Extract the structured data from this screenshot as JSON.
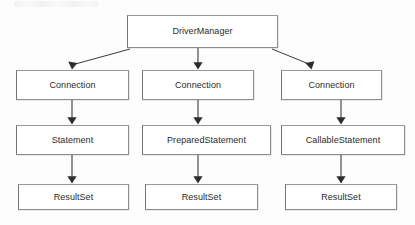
{
  "diagram": {
    "type": "hierarchical-flow",
    "background_color": "#fdfdfd",
    "box_fill_color": "#ffffff",
    "box_border_color": "#8d8d90",
    "text_color": "#2b2b2b",
    "connector_color": "#3a3a3a",
    "artifact_note": "faint illegible scan artifact strip at top-left"
  },
  "nodes": {
    "driver_manager": {
      "label": "DriverManager"
    },
    "connection_left": {
      "label": "Connection"
    },
    "connection_mid": {
      "label": "Connection"
    },
    "connection_right": {
      "label": "Connection"
    },
    "statement": {
      "label": "Statement"
    },
    "prepared_statement": {
      "label": "PreparedStatement"
    },
    "callable_statement": {
      "label": "CallableStatement"
    },
    "result_set_left": {
      "label": "ResultSet"
    },
    "result_set_mid": {
      "label": "ResultSet"
    },
    "result_set_right": {
      "label": "ResultSet"
    }
  },
  "edges": [
    {
      "from": "driver_manager",
      "to": "connection_left",
      "style": "diagonal-arrow"
    },
    {
      "from": "driver_manager",
      "to": "connection_mid",
      "style": "vertical-arrow"
    },
    {
      "from": "driver_manager",
      "to": "connection_right",
      "style": "diagonal-arrow"
    },
    {
      "from": "connection_left",
      "to": "statement",
      "style": "vertical-arrow"
    },
    {
      "from": "connection_mid",
      "to": "prepared_statement",
      "style": "vertical-arrow"
    },
    {
      "from": "connection_right",
      "to": "callable_statement",
      "style": "vertical-arrow"
    },
    {
      "from": "statement",
      "to": "result_set_left",
      "style": "vertical-arrow"
    },
    {
      "from": "prepared_statement",
      "to": "result_set_mid",
      "style": "vertical-arrow"
    },
    {
      "from": "callable_statement",
      "to": "result_set_right",
      "style": "vertical-arrow"
    }
  ]
}
